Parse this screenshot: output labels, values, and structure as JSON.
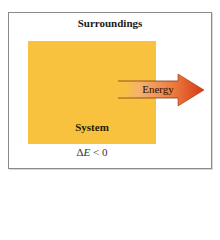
{
  "diagram": {
    "title": "Surroundings",
    "system_label": "System",
    "arrow_label": "Energy",
    "equation": {
      "delta": "Δ",
      "var": "E",
      "rest": " < 0"
    },
    "colors": {
      "system_fill": "#f8c23e",
      "arrow_start": "#f7bf72",
      "arrow_end": "#d9461a",
      "frame_border": "#8a8a8a"
    }
  }
}
